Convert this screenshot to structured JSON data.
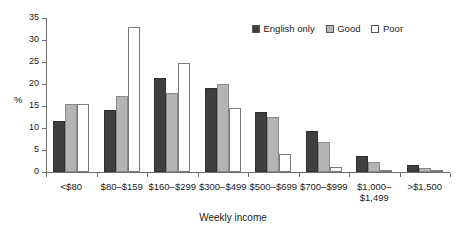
{
  "chart_data": {
    "type": "bar",
    "title": "",
    "xlabel": "Weekly income",
    "ylabel": "%",
    "ylim": [
      0,
      35
    ],
    "ytick_step": 5,
    "yticks": [
      0,
      5,
      10,
      15,
      20,
      25,
      30,
      35
    ],
    "ytick_labels": [
      "0",
      "5",
      "10",
      "15",
      "20",
      "25",
      "30",
      "35"
    ],
    "grid": false,
    "legend_position": "top-right",
    "categories": [
      "<$80",
      "$80–$159",
      "$160–$299",
      "$300–$499",
      "$500–$699",
      "$700–$999",
      "$1,000–\n$1,499",
      ">$1,500"
    ],
    "series": [
      {
        "name": "English only",
        "color": "#3f3f3f",
        "values": [
          11.7,
          14.1,
          21.3,
          19.1,
          13.7,
          9.4,
          3.6,
          1.6
        ]
      },
      {
        "name": "Good",
        "color": "#b4b4b4",
        "values": [
          15.5,
          17.2,
          17.9,
          20.1,
          12.4,
          6.9,
          2.3,
          0.8
        ]
      },
      {
        "name": "Poor",
        "color": "#ffffff",
        "values": [
          15.5,
          33.0,
          24.7,
          14.5,
          4.1,
          1.2,
          0.2,
          0.1
        ]
      }
    ]
  },
  "legend": {
    "entries": [
      {
        "label": "English only"
      },
      {
        "label": "Good"
      },
      {
        "label": "Poor"
      }
    ]
  },
  "axes": {
    "x_title": "Weekly income",
    "y_title": "%"
  }
}
